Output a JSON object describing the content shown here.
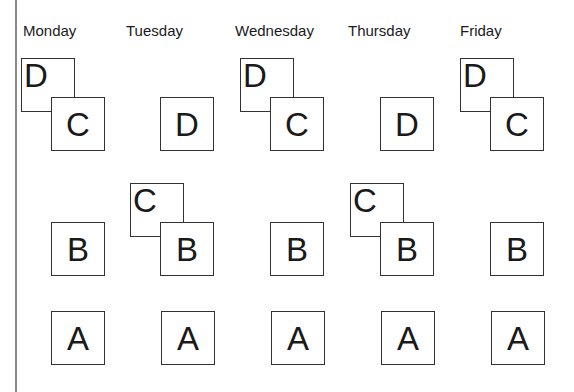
{
  "days": [
    {
      "label": "Monday",
      "stacks": [
        {
          "front": "C",
          "back": "D"
        },
        {
          "front": "B",
          "back": null
        },
        {
          "front": "A",
          "back": null
        }
      ]
    },
    {
      "label": "Tuesday",
      "stacks": [
        {
          "front": "D",
          "back": null
        },
        {
          "front": "B",
          "back": "C"
        },
        {
          "front": "A",
          "back": null
        }
      ]
    },
    {
      "label": "Wednesday",
      "stacks": [
        {
          "front": "C",
          "back": "D"
        },
        {
          "front": "B",
          "back": null
        },
        {
          "front": "A",
          "back": null
        }
      ]
    },
    {
      "label": "Thursday",
      "stacks": [
        {
          "front": "D",
          "back": null
        },
        {
          "front": "B",
          "back": "C"
        },
        {
          "front": "A",
          "back": null
        }
      ]
    },
    {
      "label": "Friday",
      "stacks": [
        {
          "front": "C",
          "back": "D"
        },
        {
          "front": "B",
          "back": null
        },
        {
          "front": "A",
          "back": null
        }
      ]
    }
  ]
}
